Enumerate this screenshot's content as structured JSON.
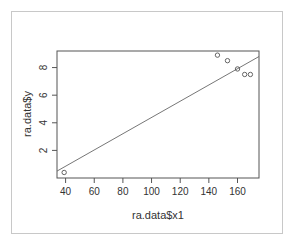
{
  "chart_data": {
    "type": "scatter",
    "title": "",
    "xlabel": "ra.data$x1",
    "ylabel": "ra.data$y",
    "xlim": [
      34,
      175
    ],
    "ylim": [
      0,
      9.2
    ],
    "x_ticks": [
      40,
      60,
      80,
      100,
      120,
      140,
      160
    ],
    "y_ticks": [
      2,
      4,
      6,
      8
    ],
    "grid": false,
    "legend": null,
    "points": [
      {
        "x": 39,
        "y": 0.4
      },
      {
        "x": 146,
        "y": 8.9
      },
      {
        "x": 153,
        "y": 8.5
      },
      {
        "x": 160,
        "y": 7.9
      },
      {
        "x": 165,
        "y": 7.5
      },
      {
        "x": 169,
        "y": 7.5
      }
    ],
    "fit_line": {
      "x0": 34,
      "y0": 0.5,
      "x1": 175,
      "y1": 8.8
    }
  },
  "colors": {
    "axis": "#555555",
    "points": "#555555",
    "line": "#666666",
    "frame": "#c8c8c8"
  }
}
